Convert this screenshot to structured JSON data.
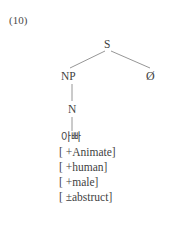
{
  "figure": {
    "example_number": "(10)",
    "type": "syntax-tree-diagram"
  },
  "tree": {
    "root": {
      "label": "S",
      "name": "sentence-node"
    },
    "children": [
      {
        "label": "NP",
        "name": "noun-phrase-node"
      },
      {
        "label": "Ø",
        "name": "null-element-node"
      }
    ],
    "np_child": {
      "label": "N",
      "name": "noun-node"
    },
    "terminal": {
      "label": "아빠",
      "name": "lexical-item"
    }
  },
  "features": [
    {
      "label": "[ +Animate]"
    },
    {
      "label": "[ +human]"
    },
    {
      "label": "[ +male]"
    },
    {
      "label": "[ ±abstruct]"
    }
  ],
  "colors": {
    "background": "#ffffff",
    "text": "#3f3f3f",
    "line": "#8a8a8a"
  }
}
